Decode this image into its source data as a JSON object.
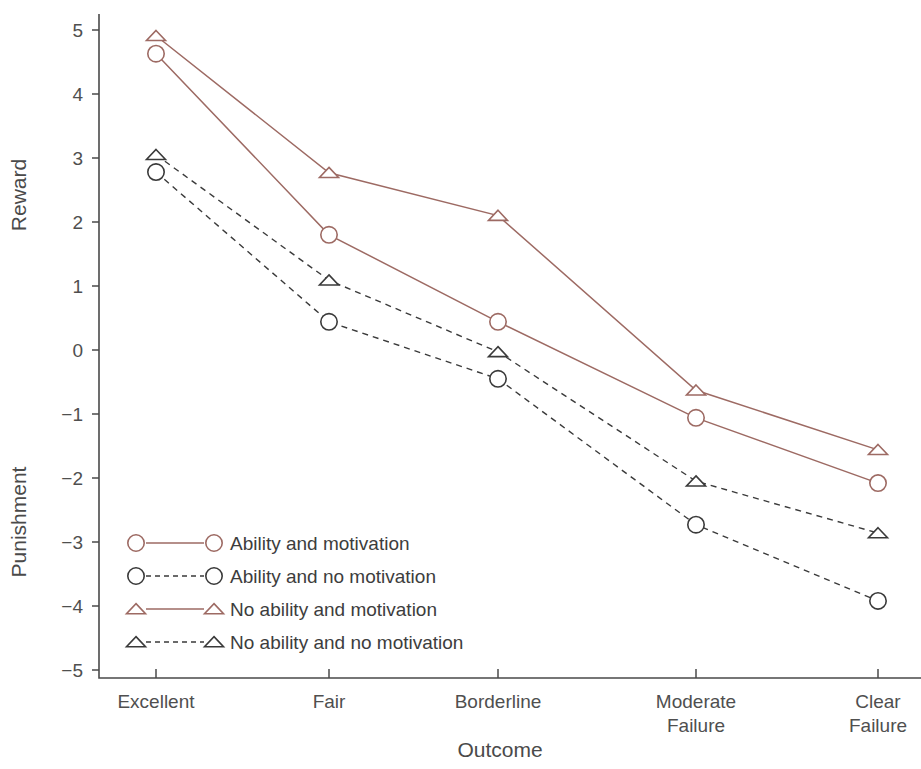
{
  "chart_data": {
    "type": "line",
    "title": "",
    "xlabel": "Outcome",
    "ylabel_upper": "Reward",
    "ylabel_lower": "Punishment",
    "categories": [
      "Excellent",
      "Fair",
      "Borderline",
      "Moderate\nFailure",
      "Clear\nFailure"
    ],
    "category_labels": [
      {
        "line1": "Excellent",
        "line2": ""
      },
      {
        "line1": "Fair",
        "line2": ""
      },
      {
        "line1": "Borderline",
        "line2": ""
      },
      {
        "line1": "Moderate",
        "line2": "Failure"
      },
      {
        "line1": "Clear",
        "line2": "Failure"
      }
    ],
    "ylim": [
      -5,
      5
    ],
    "yticks": [
      5,
      4,
      3,
      2,
      1,
      0,
      -1,
      -2,
      -3,
      -4,
      -5
    ],
    "ytick_labels": [
      "5",
      "4",
      "3",
      "2",
      "1",
      "0",
      "−1",
      "−2",
      "−3",
      "−4",
      "−5"
    ],
    "grid": false,
    "legend_position": "lower-left-inside",
    "series": [
      {
        "name": "Ability and motivation",
        "marker": "circle",
        "line_style": "solid",
        "color": "#9d6a63",
        "values": [
          4.63,
          1.8,
          0.44,
          -1.06,
          -2.08
        ]
      },
      {
        "name": "Ability and no motivation",
        "marker": "circle",
        "line_style": "dashed",
        "color": "#3a3a3a",
        "values": [
          2.78,
          0.44,
          -0.45,
          -2.73,
          -3.92
        ]
      },
      {
        "name": "No ability and motivation",
        "marker": "triangle",
        "line_style": "solid",
        "color": "#9d6a63",
        "values": [
          4.91,
          2.77,
          2.1,
          -0.63,
          -1.56
        ]
      },
      {
        "name": "No ability and no motivation",
        "marker": "triangle",
        "line_style": "dashed",
        "color": "#3a3a3a",
        "values": [
          3.05,
          1.09,
          -0.03,
          -2.05,
          -2.86
        ]
      }
    ]
  },
  "legend": {
    "entries": [
      {
        "label": "Ability and motivation",
        "marker": "circle",
        "line_style": "solid",
        "color": "#9d6a63"
      },
      {
        "label": "Ability and no motivation",
        "marker": "circle",
        "line_style": "dashed",
        "color": "#3a3a3a"
      },
      {
        "label": "No ability and motivation",
        "marker": "triangle",
        "line_style": "solid",
        "color": "#9d6a63"
      },
      {
        "label": "No ability and no motivation",
        "marker": "triangle",
        "line_style": "dashed",
        "color": "#3a3a3a"
      }
    ]
  }
}
